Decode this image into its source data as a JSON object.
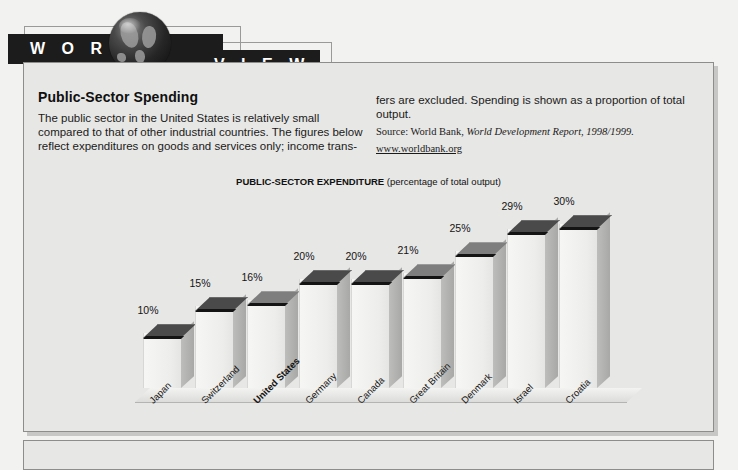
{
  "banner": {
    "word_left": "W O R L D",
    "word_right": "V I E W",
    "globe_icon": "globe-icon"
  },
  "article": {
    "headline": "Public-Sector Spending",
    "left_column": "The public sector in the United States is relatively small compared to that of other industrial countries. The figures below reflect expenditures on goods and services only; income trans-",
    "right_column": "fers are excluded. Spending is shown as a proportion of total output.",
    "source_prefix": "Source: World Bank, ",
    "source_italic": "World Development Report, 1998/1999.",
    "source_url": "www.worldbank.org"
  },
  "chart_data": {
    "type": "bar",
    "title": "PUBLIC-SECTOR EXPENDITURE",
    "subtitle": "(percentage of total output)",
    "xlabel": "",
    "ylabel": "",
    "ylim": [
      0,
      32
    ],
    "grid": false,
    "legend": null,
    "value_suffix": "%",
    "highlight_category": "United States",
    "categories": [
      "Japan",
      "Switzerland",
      "United States",
      "Germany",
      "Canada",
      "Great Britain",
      "Denmark",
      "Israel",
      "Croatia"
    ],
    "values": [
      10,
      15,
      16,
      20,
      20,
      21,
      25,
      29,
      30
    ],
    "value_labels": [
      "10%",
      "15%",
      "16%",
      "20%",
      "20%",
      "21%",
      "25%",
      "29%",
      "30%"
    ],
    "top_face_shade": [
      "dark",
      "dark",
      "light",
      "dark",
      "dark",
      "light",
      "light",
      "dark",
      "dark"
    ]
  },
  "colors": {
    "page_background": "#f2f2f0",
    "panel_background": "#e7e7e5",
    "panel_border": "#8d8d8b",
    "banner_bar": "#1c1c1c",
    "bar_front": "#f0f0ee",
    "bar_side": "#b2b2b0",
    "bar_top_dark": "#4a4a4a",
    "bar_top_light": "#7e7e7e",
    "text": "#141414"
  }
}
